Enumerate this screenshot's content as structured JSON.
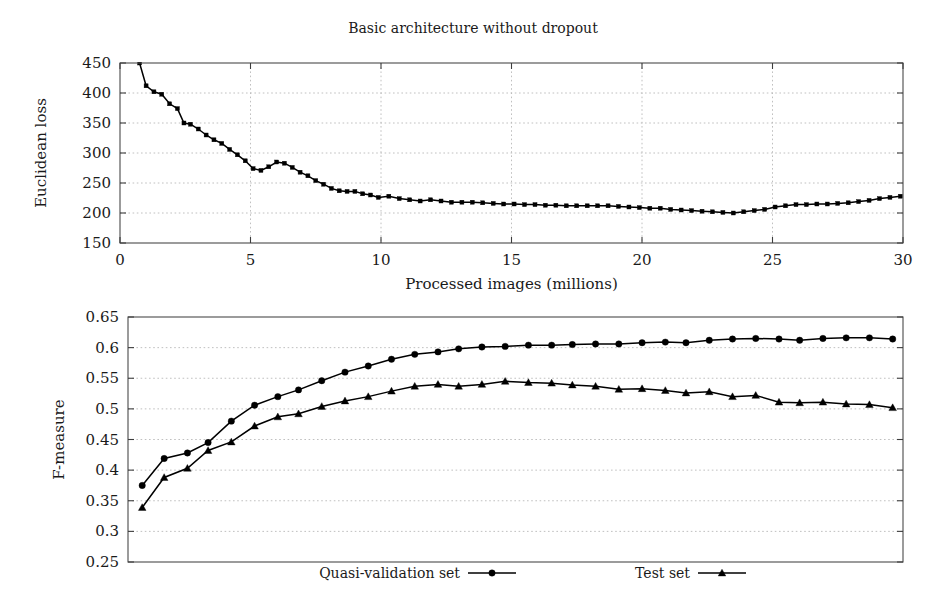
{
  "figure": {
    "title": "Basic architecture without dropout"
  },
  "chart_data": [
    {
      "type": "line",
      "title": "Basic architecture without dropout",
      "xlabel": "Processed images (millions)",
      "ylabel": "Euclidean loss",
      "xlim": [
        0,
        30
      ],
      "ylim": [
        150,
        450
      ],
      "xticks": [
        0,
        5,
        10,
        15,
        20,
        25,
        30
      ],
      "xtick_labels": [
        "0",
        "5",
        "10",
        "15",
        "20",
        "25",
        "30"
      ],
      "yticks": [
        150,
        200,
        250,
        300,
        350,
        400,
        450
      ],
      "ytick_labels": [
        "150",
        "200",
        "250",
        "300",
        "350",
        "400",
        "450"
      ],
      "grid": true,
      "legend": "none",
      "marker": "square",
      "series": [
        {
          "name": "Euclidean loss",
          "marker": "square",
          "x": [
            0.75,
            1.0,
            1.3,
            1.6,
            1.9,
            2.2,
            2.45,
            2.7,
            3.0,
            3.3,
            3.6,
            3.9,
            4.2,
            4.5,
            4.8,
            5.1,
            5.4,
            5.7,
            6.0,
            6.3,
            6.6,
            6.9,
            7.2,
            7.5,
            7.8,
            8.1,
            8.4,
            8.7,
            9.0,
            9.3,
            9.6,
            9.9,
            10.3,
            10.7,
            11.1,
            11.5,
            11.9,
            12.3,
            12.7,
            13.1,
            13.5,
            13.9,
            14.3,
            14.7,
            15.1,
            15.5,
            15.9,
            16.3,
            16.7,
            17.1,
            17.5,
            17.9,
            18.3,
            18.7,
            19.1,
            19.5,
            19.9,
            20.3,
            20.7,
            21.1,
            21.5,
            21.9,
            22.3,
            22.7,
            23.1,
            23.5,
            23.9,
            24.3,
            24.7,
            25.1,
            25.5,
            25.9,
            26.3,
            26.7,
            27.1,
            27.5,
            27.9,
            28.3,
            28.7,
            29.1,
            29.5,
            29.9
          ],
          "y": [
            450,
            412,
            402,
            398,
            382,
            374,
            350,
            348,
            340,
            330,
            322,
            316,
            306,
            297,
            287,
            274,
            271,
            277,
            285,
            283,
            276,
            268,
            262,
            254,
            248,
            241,
            237,
            236,
            236,
            232,
            230,
            226,
            228,
            224,
            222,
            220,
            222,
            220,
            218,
            218,
            218,
            217,
            216,
            215,
            215,
            214,
            214,
            213,
            213,
            212,
            212,
            212,
            212,
            212,
            211,
            210,
            209,
            208,
            208,
            206,
            205,
            204,
            203,
            202,
            201,
            200,
            202,
            204,
            206,
            210,
            212,
            214,
            214,
            215,
            215,
            216,
            217,
            219,
            221,
            224,
            226,
            228
          ]
        }
      ]
    },
    {
      "type": "line",
      "title": "",
      "xlabel": "",
      "ylabel": "F-measure",
      "xlim": [
        0,
        30
      ],
      "ylim": [
        0.25,
        0.65
      ],
      "xticks": [],
      "xtick_labels": [],
      "yticks": [
        0.25,
        0.3,
        0.35,
        0.4,
        0.45,
        0.5,
        0.55,
        0.6,
        0.65
      ],
      "ytick_labels": [
        "0.25",
        "0.3",
        "0.35",
        "0.4",
        "0.45",
        "0.5",
        "0.55",
        "0.6",
        "0.65"
      ],
      "grid": true,
      "legend": "bottom-outside",
      "series": [
        {
          "name": "Quasi-validation set",
          "marker": "circle",
          "x": [
            0.55,
            1.4,
            2.3,
            3.1,
            4.0,
            4.9,
            5.8,
            6.6,
            7.5,
            8.4,
            9.3,
            10.2,
            11.1,
            12.0,
            12.8,
            13.7,
            14.6,
            15.5,
            16.4,
            17.2,
            18.1,
            19.0,
            19.9,
            20.8,
            21.6,
            22.5,
            23.4,
            24.3,
            25.2,
            26.0,
            26.9,
            27.8,
            28.7,
            29.6
          ],
          "y": [
            0.375,
            0.419,
            0.428,
            0.445,
            0.48,
            0.506,
            0.52,
            0.531,
            0.546,
            0.56,
            0.57,
            0.581,
            0.589,
            0.593,
            0.598,
            0.601,
            0.602,
            0.604,
            0.604,
            0.605,
            0.606,
            0.606,
            0.608,
            0.609,
            0.608,
            0.612,
            0.614,
            0.615,
            0.614,
            0.612,
            0.615,
            0.616,
            0.616,
            0.614
          ]
        },
        {
          "name": "Test set",
          "marker": "triangle",
          "x": [
            0.55,
            1.4,
            2.3,
            3.1,
            4.0,
            4.9,
            5.8,
            6.6,
            7.5,
            8.4,
            9.3,
            10.2,
            11.1,
            12.0,
            12.8,
            13.7,
            14.6,
            15.5,
            16.4,
            17.2,
            18.1,
            19.0,
            19.9,
            20.8,
            21.6,
            22.5,
            23.4,
            24.3,
            25.2,
            26.0,
            26.9,
            27.8,
            28.7,
            29.6
          ],
          "y": [
            0.339,
            0.388,
            0.403,
            0.432,
            0.446,
            0.472,
            0.487,
            0.492,
            0.504,
            0.513,
            0.52,
            0.529,
            0.537,
            0.54,
            0.537,
            0.54,
            0.545,
            0.543,
            0.542,
            0.539,
            0.537,
            0.532,
            0.533,
            0.53,
            0.526,
            0.528,
            0.52,
            0.522,
            0.511,
            0.51,
            0.511,
            0.508,
            0.507,
            0.502
          ]
        }
      ]
    }
  ],
  "legend": {
    "items": [
      {
        "label": "Quasi-validation set",
        "marker": "circle"
      },
      {
        "label": "Test set",
        "marker": "triangle"
      }
    ]
  }
}
